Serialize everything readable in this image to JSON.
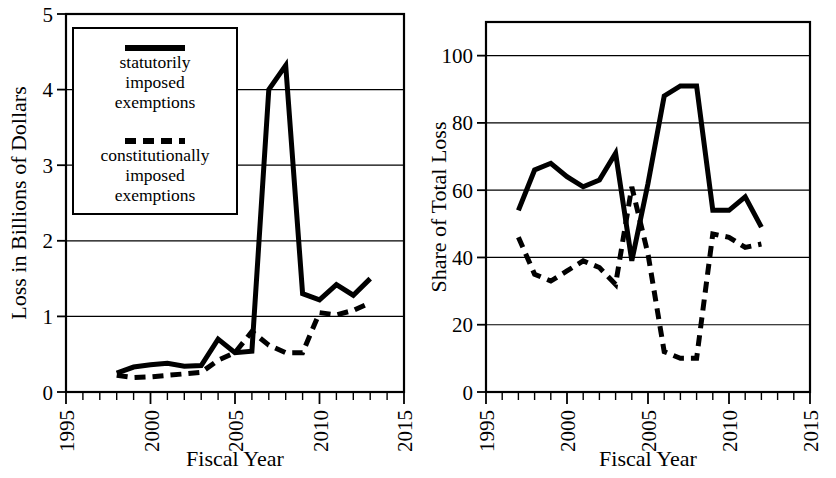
{
  "figure": {
    "panels": [
      "left",
      "right"
    ]
  },
  "legend": {
    "entries": [
      {
        "id": "statutory",
        "style": "solid",
        "label_lines": [
          "statutorily",
          "imposed",
          "exemptions"
        ]
      },
      {
        "id": "constitutional",
        "style": "dashed",
        "label_lines": [
          "constitutionally",
          "imposed",
          "exemptions"
        ]
      }
    ]
  },
  "chart_data": [
    {
      "type": "line",
      "id": "loss-billions",
      "title": "",
      "xlabel": "Fiscal Year",
      "ylabel": "Loss in Billions of Dollars",
      "xlim": [
        1995,
        2015
      ],
      "ylim": [
        0,
        5
      ],
      "xticks": [
        1995,
        2000,
        2005,
        2010,
        2015
      ],
      "xticklabels": [
        "1995",
        "2000",
        "2005",
        "2010",
        "2015"
      ],
      "yticks": [
        0,
        1,
        2,
        3,
        4,
        5
      ],
      "yticklabels": [
        "0",
        "1",
        "2",
        "3",
        "4",
        "5"
      ],
      "minor_xtick_interval": 1,
      "grid": "horizontal",
      "legend_position": "upper-left-inset",
      "series": [
        {
          "name": "statutorily imposed exemptions",
          "style": "solid",
          "x": [
            1998,
            1999,
            2000,
            2001,
            2002,
            2003,
            2004,
            2005,
            2006,
            2007,
            2008,
            2009,
            2010,
            2011,
            2012,
            2013
          ],
          "values": [
            0.25,
            0.33,
            0.36,
            0.38,
            0.34,
            0.35,
            0.7,
            0.52,
            0.54,
            4.0,
            4.32,
            1.3,
            1.22,
            1.42,
            1.28,
            1.5
          ]
        },
        {
          "name": "constitutionally imposed exemptions",
          "style": "dashed",
          "x": [
            1998,
            1999,
            2000,
            2001,
            2002,
            2003,
            2004,
            2005,
            2006,
            2007,
            2008,
            2009,
            2010,
            2011,
            2012,
            2013
          ],
          "values": [
            0.22,
            0.19,
            0.2,
            0.22,
            0.24,
            0.26,
            0.42,
            0.52,
            0.8,
            0.62,
            0.52,
            0.52,
            1.05,
            1.02,
            1.08,
            1.18
          ]
        }
      ]
    },
    {
      "type": "line",
      "id": "share-of-total-loss",
      "title": "",
      "xlabel": "Fiscal Year",
      "ylabel": "Share of Total Loss",
      "xlim": [
        1995,
        2015
      ],
      "ylim": [
        0,
        110
      ],
      "xticks": [
        1995,
        2000,
        2005,
        2010,
        2015
      ],
      "xticklabels": [
        "1995",
        "2000",
        "2005",
        "2010",
        "2015"
      ],
      "yticks": [
        0,
        20,
        40,
        60,
        80,
        100
      ],
      "yticklabels": [
        "0",
        "20",
        "40",
        "60",
        "80",
        "100"
      ],
      "minor_xtick_interval": 1,
      "grid": "horizontal",
      "legend_position": "none",
      "series": [
        {
          "name": "statutorily imposed exemptions",
          "style": "solid",
          "x": [
            1997,
            1998,
            1999,
            2000,
            2001,
            2002,
            2003,
            2004,
            2005,
            2006,
            2007,
            2008,
            2009,
            2010,
            2011,
            2012
          ],
          "values": [
            54,
            66,
            68,
            64,
            61,
            63,
            71,
            39,
            62,
            88,
            91,
            91,
            54,
            54,
            58,
            49
          ]
        },
        {
          "name": "constitutionally imposed exemptions",
          "style": "dashed",
          "x": [
            1997,
            1998,
            1999,
            2000,
            2001,
            2002,
            2003,
            2004,
            2005,
            2006,
            2007,
            2008,
            2009,
            2010,
            2011,
            2012
          ],
          "values": [
            46,
            35,
            33,
            36,
            39,
            37,
            32,
            61,
            41,
            12,
            10,
            10,
            47,
            46,
            43,
            44
          ]
        }
      ]
    }
  ]
}
